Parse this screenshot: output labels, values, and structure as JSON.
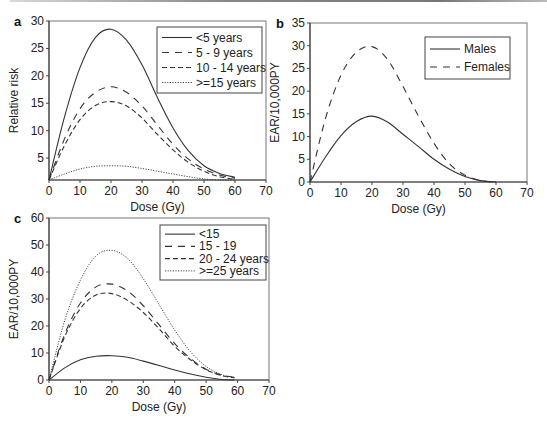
{
  "chart_data": [
    {
      "panel": "a",
      "type": "line",
      "title": "",
      "xlabel": "Dose (Gy)",
      "ylabel": "Relative risk",
      "xlim": [
        0,
        70
      ],
      "ylim": [
        1,
        30
      ],
      "xticks": [
        0,
        10,
        20,
        30,
        40,
        50,
        60,
        70
      ],
      "yticks": [
        5,
        10,
        15,
        20,
        25,
        30
      ],
      "grid": false,
      "legend_position": "upper right",
      "x": [
        0,
        5,
        10,
        15,
        20,
        25,
        30,
        35,
        40,
        45,
        50,
        55,
        60
      ],
      "series": [
        {
          "name": "<5 years",
          "style": "solid",
          "values": [
            1,
            12.5,
            21.5,
            27,
            28.5,
            26.5,
            22,
            16,
            10.5,
            6.3,
            3.6,
            2.2,
            1.5
          ]
        },
        {
          "name": "5 - 9 years",
          "style": "longdash",
          "values": [
            1,
            8.5,
            14,
            17,
            18,
            17,
            14.5,
            11,
            7.5,
            4.8,
            3,
            1.9,
            1.3
          ]
        },
        {
          "name": "10 - 14 years",
          "style": "dash",
          "values": [
            1,
            7.3,
            12,
            14.6,
            15.3,
            14.5,
            12.3,
            9.3,
            6.5,
            4.2,
            2.6,
            1.6,
            1.1
          ]
        },
        {
          "name": ">=15 years",
          "style": "dotted",
          "values": [
            1,
            2.1,
            3,
            3.5,
            3.6,
            3.5,
            3.1,
            2.6,
            2.1,
            1.6,
            1.2,
            1.0,
            1.0
          ]
        }
      ]
    },
    {
      "panel": "b",
      "type": "line",
      "title": "",
      "xlabel": "Dose (Gy)",
      "ylabel": "EAR/10,000PY",
      "xlim": [
        0,
        70
      ],
      "ylim": [
        0,
        35
      ],
      "xticks": [
        0,
        10,
        20,
        30,
        40,
        50,
        60,
        70
      ],
      "yticks": [
        0,
        5,
        10,
        15,
        20,
        25,
        30,
        35
      ],
      "grid": false,
      "legend_position": "upper right",
      "x": [
        0,
        5,
        10,
        15,
        20,
        25,
        30,
        35,
        40,
        45,
        50,
        55,
        60
      ],
      "series": [
        {
          "name": "Males",
          "style": "solid",
          "values": [
            0,
            5.5,
            10.2,
            13.3,
            14.5,
            13.2,
            10.5,
            7.8,
            5,
            2.8,
            1.2,
            0.3,
            0
          ]
        },
        {
          "name": "Females",
          "style": "longdash",
          "values": [
            0,
            14,
            23.5,
            28.6,
            29.8,
            27,
            21,
            14.5,
            8.5,
            4,
            1.5,
            0.3,
            0
          ]
        }
      ]
    },
    {
      "panel": "c",
      "type": "line",
      "title": "",
      "xlabel": "Dose (Gy)",
      "ylabel": "EAR/10,000PY",
      "xlim": [
        0,
        70
      ],
      "ylim": [
        0,
        60
      ],
      "xticks": [
        0,
        10,
        20,
        30,
        40,
        50,
        60,
        70
      ],
      "yticks": [
        0,
        10,
        20,
        30,
        40,
        50,
        60
      ],
      "grid": false,
      "legend_position": "upper right",
      "x": [
        0,
        5,
        10,
        15,
        20,
        25,
        30,
        35,
        40,
        45,
        50,
        55,
        59
      ],
      "series": [
        {
          "name": "<15",
          "style": "solid",
          "values": [
            0,
            4.5,
            7.5,
            8.8,
            9,
            8.4,
            7,
            5.4,
            3.7,
            2.2,
            1,
            0.2,
            0
          ]
        },
        {
          "name": "15 - 19",
          "style": "longdash",
          "values": [
            0,
            17,
            28.5,
            34.5,
            35.5,
            33,
            27.5,
            20.5,
            13.5,
            8,
            4,
            1.8,
            1
          ]
        },
        {
          "name": "20 - 24 years",
          "style": "dash",
          "values": [
            0,
            16,
            26.5,
            31.5,
            32,
            29.5,
            25,
            19,
            12.5,
            7.5,
            3.8,
            1.6,
            0.8
          ]
        },
        {
          "name": ">=25 years",
          "style": "dotted",
          "values": [
            0,
            22,
            37,
            46,
            48,
            45,
            37.5,
            28,
            18.5,
            10.5,
            5,
            2,
            1
          ]
        }
      ]
    }
  ],
  "panels": {
    "a": {
      "letter": "a",
      "ylabel": "Relative risk",
      "xlabel": "Dose (Gy)"
    },
    "b": {
      "letter": "b",
      "ylabel": "EAR/10,000PY",
      "xlabel": "Dose (Gy)"
    },
    "c": {
      "letter": "c",
      "ylabel": "EAR/10,000PY",
      "xlabel": "Dose (Gy)"
    }
  },
  "layout": {
    "a": {
      "x0": 49,
      "x1": 266,
      "yTop": 21,
      "yBot": 180
    },
    "b": {
      "x0": 310,
      "x1": 527,
      "yTop": 23,
      "yBot": 182
    },
    "c": {
      "x0": 49,
      "x1": 269,
      "yTop": 218,
      "yBot": 380
    }
  },
  "legends": {
    "a": {
      "box": [
        157,
        27,
        105,
        66
      ]
    },
    "b": {
      "box": [
        425,
        37,
        85,
        42
      ]
    },
    "c": {
      "box": [
        160,
        225,
        106,
        55
      ]
    }
  },
  "colors": {
    "line": "#333333",
    "axis": "#444444",
    "text": "#222222",
    "border": "#777777"
  }
}
